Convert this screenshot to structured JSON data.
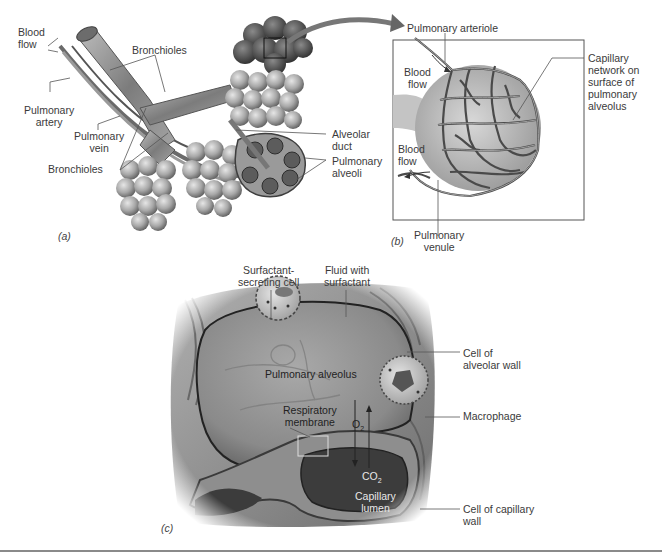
{
  "figure": {
    "panels": [
      {
        "id": "a",
        "tag": "(a)"
      },
      {
        "id": "b",
        "tag": "(b)"
      },
      {
        "id": "c",
        "tag": "(c)"
      }
    ]
  },
  "panel_a": {
    "labels": {
      "blood_flow": "Blood\nflow",
      "bronchioles_top": "Bronchioles",
      "pulmonary_artery": "Pulmonary\nartery",
      "pulmonary_vein": "Pulmonary\nvein",
      "bronchioles_bottom": "Bronchioles",
      "alveolar_duct": "Alveolar\nduct",
      "pulmonary_alveoli": "Pulmonary\nalveoli"
    },
    "tag": "(a)"
  },
  "panel_b": {
    "labels": {
      "pulmonary_arteriole": "Pulmonary arteriole",
      "blood_flow_in": "Blood\nflow",
      "blood_flow_out": "Blood\nflow",
      "capillary_network": "Capillary\nnetwork on\nsurface of\npulmonary\nalveolus",
      "pulmonary_venule": "Pulmonary\nvenule"
    },
    "tag": "(b)"
  },
  "panel_c": {
    "labels": {
      "surfactant_cell": "Surfactant-\nsecreting cell",
      "fluid_surfactant": "Fluid with\nsurfactant",
      "cell_alveolar_wall": "Cell of\nalveolar wall",
      "pulmonary_alveolus": "Pulmonary alveolus",
      "respiratory_membrane": "Respiratory\nmembrane",
      "o2": "O",
      "o2_sub": "2",
      "co2": "CO",
      "co2_sub": "2",
      "macrophage": "Macrophage",
      "capillary_lumen": "Capillary\nlumen",
      "cell_capillary_wall": "Cell of capillary\nwall"
    },
    "tag": "(c)"
  },
  "colors": {
    "background": "#ffffff",
    "text": "#3a3a3a",
    "leader": "#555555",
    "tissue_dark": "#4a4a4a",
    "tissue_mid": "#8c8c8c",
    "tissue_light": "#c8c8c8"
  }
}
